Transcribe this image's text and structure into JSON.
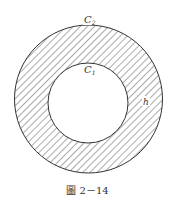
{
  "figure": {
    "caption": "圖 2－14",
    "labels": {
      "outer_circle": "C",
      "outer_circle_sub": "2",
      "inner_circle": "C",
      "inner_circle_sub": "1",
      "width": "h"
    },
    "geometry": {
      "outer": {
        "cx": 88.5,
        "cy": 99,
        "r": 74
      },
      "inner": {
        "cx": 88,
        "cy": 103,
        "r": 40
      }
    },
    "colors": {
      "stroke": "#333333",
      "hatch": "#444444",
      "background": "#ffffff"
    }
  }
}
